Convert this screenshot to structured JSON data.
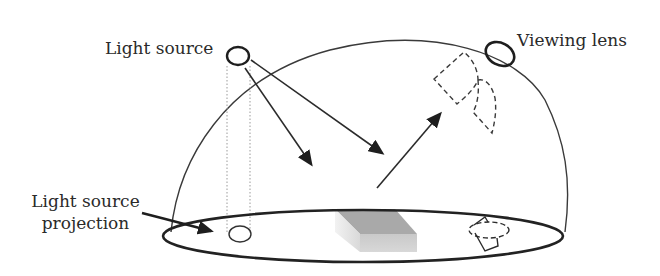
{
  "diagram": {
    "labels": {
      "light_source": "Light source",
      "viewing_lens": "Viewing lens",
      "light_source_projection_line1": "Light source",
      "light_source_projection_line2": "projection"
    },
    "elements": [
      {
        "name": "hemispherical-dome",
        "shape": "arc"
      },
      {
        "name": "base-ellipse",
        "shape": "ellipse"
      },
      {
        "name": "light-source",
        "shape": "circle-outline"
      },
      {
        "name": "viewing-lens",
        "shape": "ellipse-outline"
      },
      {
        "name": "light-source-projection",
        "shape": "small-ellipse"
      },
      {
        "name": "sample-block",
        "shape": "gray-3d-box"
      },
      {
        "name": "incident-arrow-1",
        "shape": "arrow"
      },
      {
        "name": "incident-arrow-2",
        "shape": "arrow"
      },
      {
        "name": "reflected-arrow",
        "shape": "arrow"
      },
      {
        "name": "lens-field-of-view-on-dome",
        "shape": "dashed-outline"
      },
      {
        "name": "lens-field-of-view-on-base",
        "shape": "dashed-outline"
      }
    ],
    "colors": {
      "stroke": "#2b2b2b",
      "dotted": "#9a9a9a",
      "block_top": "#a8a8a8",
      "block_front": "#cfcfcf",
      "block_side": "#e6e6e6",
      "background": "#ffffff"
    }
  }
}
